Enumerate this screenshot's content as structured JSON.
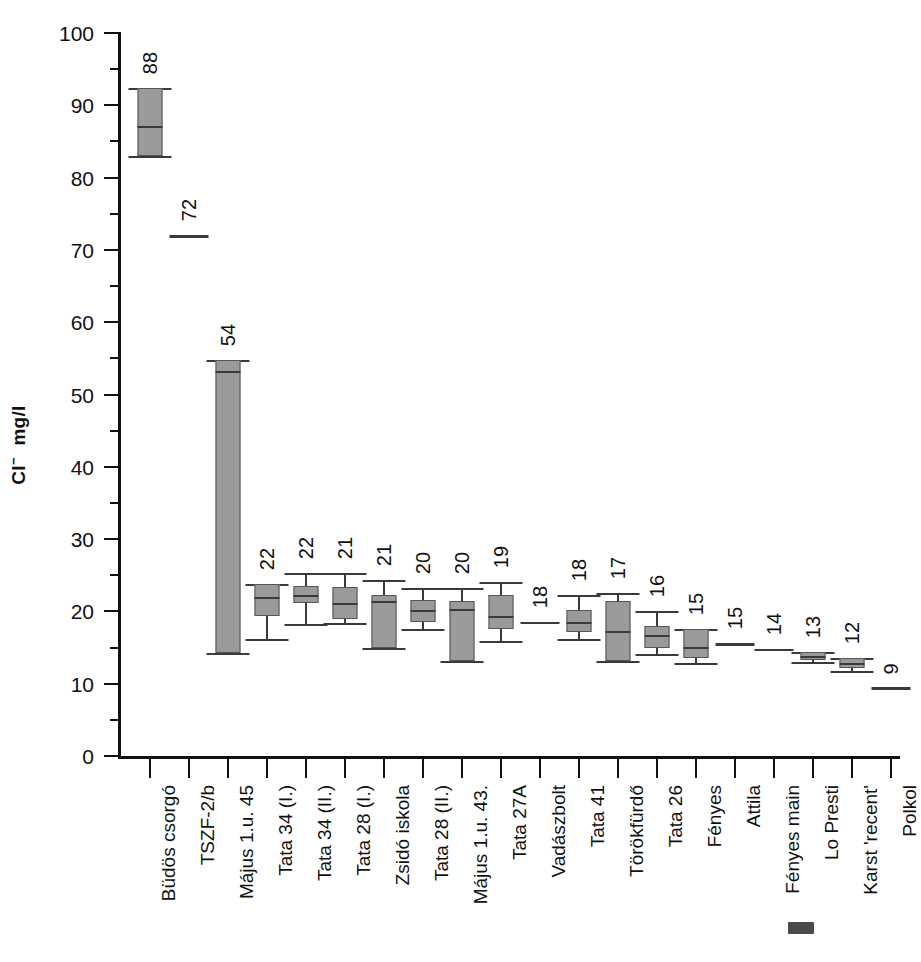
{
  "chart_data": {
    "type": "boxplot",
    "title": "",
    "xlabel": "",
    "ylabel": "Cl- mg/l",
    "ylabel_ion": "Cl",
    "ylabel_charge": "−",
    "ylabel_unit": "mg/l",
    "ylim": [
      0,
      100
    ],
    "ytick_major": [
      0,
      10,
      20,
      30,
      40,
      50,
      60,
      70,
      80,
      90,
      100
    ],
    "ytick_minor": [
      5,
      15,
      25,
      35,
      45,
      55,
      65,
      75,
      85,
      95
    ],
    "grid": false,
    "legend": "none",
    "sorted_by": "median descending",
    "categories": [
      "Büdös csorgó",
      "TSZF-2/b",
      "Május 1.u. 45",
      "Tata 34 (I.)",
      "Tata 34 (II.)",
      "Tata 28 (I.)",
      "Zsidó iskola",
      "Tata 28 (II.)",
      "Május 1.u. 43.",
      "Tata 27A",
      "Vadászbolt",
      "Tata 41",
      "Törökfürdő",
      "Tata 26",
      "Fényes",
      "Attila",
      "Fényes main",
      "Lo Presti",
      "Karst 'recent'",
      "Polkol"
    ],
    "labels": [
      88,
      72,
      54,
      22,
      22,
      21,
      21,
      20,
      20,
      19,
      18,
      18,
      17,
      16,
      15,
      15,
      14,
      13,
      12,
      9
    ],
    "boxes": [
      {
        "category": "Büdös csorgó",
        "label": 88,
        "kind": "box",
        "whisker_low": 83.0,
        "q1": 83.0,
        "median": 87.2,
        "q3": 92.4,
        "whisker_high": 92.4
      },
      {
        "category": "TSZF-2/b",
        "label": 72,
        "kind": "single",
        "median": 72.0
      },
      {
        "category": "Május 1.u. 45",
        "label": 54,
        "kind": "box",
        "whisker_low": 14.2,
        "q1": 14.2,
        "median": 53.2,
        "q3": 54.8,
        "whisker_high": 54.8
      },
      {
        "category": "Tata 34 (I.)",
        "label": 22,
        "kind": "box",
        "whisker_low": 16.2,
        "q1": 19.3,
        "median": 22.0,
        "q3": 23.8,
        "whisker_high": 23.8
      },
      {
        "category": "Tata 34 (II.)",
        "label": 22,
        "kind": "box",
        "whisker_low": 18.3,
        "q1": 21.2,
        "median": 22.2,
        "q3": 23.5,
        "whisker_high": 25.3
      },
      {
        "category": "Tata 28 (I.)",
        "label": 21,
        "kind": "box",
        "whisker_low": 18.4,
        "q1": 18.9,
        "median": 21.1,
        "q3": 23.4,
        "whisker_high": 25.3
      },
      {
        "category": "Zsidó iskola",
        "label": 21,
        "kind": "box",
        "whisker_low": 15.0,
        "q1": 15.0,
        "median": 21.5,
        "q3": 22.2,
        "whisker_high": 24.4
      },
      {
        "category": "Tata 28 (II.)",
        "label": 20,
        "kind": "box",
        "whisker_low": 17.6,
        "q1": 18.5,
        "median": 20.2,
        "q3": 21.6,
        "whisker_high": 23.3
      },
      {
        "category": "Május 1.u. 43.",
        "label": 20,
        "kind": "box",
        "whisker_low": 13.1,
        "q1": 13.1,
        "median": 20.4,
        "q3": 21.4,
        "whisker_high": 23.3
      },
      {
        "category": "Tata 27A",
        "label": 19,
        "kind": "box",
        "whisker_low": 15.9,
        "q1": 17.5,
        "median": 19.4,
        "q3": 22.2,
        "whisker_high": 24.1
      },
      {
        "category": "Vadászbolt",
        "label": 18,
        "kind": "single",
        "median": 18.6
      },
      {
        "category": "Tata 41",
        "label": 18,
        "kind": "box",
        "whisker_low": 16.2,
        "q1": 17.1,
        "median": 18.5,
        "q3": 20.2,
        "whisker_high": 22.2
      },
      {
        "category": "Törökfürdő",
        "label": 17,
        "kind": "box",
        "whisker_low": 13.2,
        "q1": 13.2,
        "median": 17.3,
        "q3": 21.4,
        "whisker_high": 22.5
      },
      {
        "category": "Tata 26",
        "label": 16,
        "kind": "box",
        "whisker_low": 14.1,
        "q1": 15.0,
        "median": 16.8,
        "q3": 18.0,
        "whisker_high": 20.0
      },
      {
        "category": "Fényes",
        "label": 15,
        "kind": "box",
        "whisker_low": 12.8,
        "q1": 13.5,
        "median": 15.1,
        "q3": 17.6,
        "whisker_high": 17.6
      },
      {
        "category": "Attila",
        "label": 15,
        "kind": "single",
        "median": 15.6
      },
      {
        "category": "Fényes main",
        "label": 14,
        "kind": "single",
        "median": 14.8
      },
      {
        "category": "Lo Presti",
        "label": 13,
        "kind": "box",
        "whisker_low": 13.0,
        "q1": 13.3,
        "median": 13.9,
        "q3": 14.4,
        "whisker_high": 14.4
      },
      {
        "category": "Karst 'recent'",
        "label": 12,
        "kind": "box",
        "whisker_low": 11.8,
        "q1": 12.2,
        "median": 12.9,
        "q3": 13.6,
        "whisker_high": 13.6
      },
      {
        "category": "Polkol",
        "label": 9,
        "kind": "single",
        "median": 9.5
      }
    ]
  },
  "colors": {
    "box_fill": "#9a9a9a",
    "box_stroke": "#555555",
    "axis": "#111111",
    "whisker": "#3a3a3a",
    "background": "#ffffff"
  }
}
